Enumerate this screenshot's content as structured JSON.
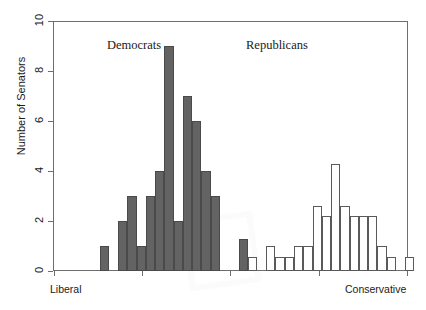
{
  "chart_data": {
    "type": "bar",
    "title": "",
    "subtitle": "",
    "xlabel": "",
    "ylabel": "Number of Senators",
    "ylim": [
      0,
      10
    ],
    "yticks": [
      0,
      2,
      4,
      6,
      8,
      10
    ],
    "ytick_labels": [
      "0",
      "2",
      "4",
      "6",
      "8",
      "10"
    ],
    "xlim": [
      0,
      1
    ],
    "xtick_labels": [
      "Liberal",
      "Conservative"
    ],
    "xtick_left_label": "Liberal",
    "xtick_right_label": "Conservative",
    "grid": false,
    "legend_position": "inline-annotations",
    "annotations": [
      {
        "text": "Democrats",
        "x": 0.26,
        "y": 9.6
      },
      {
        "text": "Republicans",
        "x": 0.66,
        "y": 9.6
      }
    ],
    "series": [
      {
        "name": "Democrats",
        "color": "#636363",
        "fill": "solid-gray",
        "bins": [
          {
            "x": 0.148,
            "width": 0.0295,
            "value": 1
          },
          {
            "x": 0.207,
            "width": 0.0295,
            "value": 2
          },
          {
            "x": 0.2365,
            "width": 0.0295,
            "value": 3
          },
          {
            "x": 0.266,
            "width": 0.0295,
            "value": 1
          },
          {
            "x": 0.2955,
            "width": 0.0295,
            "value": 3
          },
          {
            "x": 0.325,
            "width": 0.0295,
            "value": 4
          },
          {
            "x": 0.3545,
            "width": 0.0295,
            "value": 9
          },
          {
            "x": 0.384,
            "width": 0.0295,
            "value": 2
          },
          {
            "x": 0.4135,
            "width": 0.0295,
            "value": 7
          },
          {
            "x": 0.443,
            "width": 0.0295,
            "value": 6
          },
          {
            "x": 0.4725,
            "width": 0.0295,
            "value": 4
          },
          {
            "x": 0.502,
            "width": 0.0295,
            "value": 3
          },
          {
            "x": 0.5905,
            "width": 0.0295,
            "value": 1.3
          }
        ]
      },
      {
        "name": "Republicans",
        "color": "#ffffff",
        "fill": "hollow-outline",
        "bins": [
          {
            "x": 0.62,
            "width": 0.0295,
            "value": 0.55
          },
          {
            "x": 0.6785,
            "width": 0.0295,
            "value": 1.0
          },
          {
            "x": 0.708,
            "width": 0.0295,
            "value": 0.55
          },
          {
            "x": 0.7375,
            "width": 0.0295,
            "value": 0.55
          },
          {
            "x": 0.767,
            "width": 0.0295,
            "value": 1.0
          },
          {
            "x": 0.7965,
            "width": 0.0295,
            "value": 1.0
          },
          {
            "x": 0.826,
            "width": 0.0295,
            "value": 2.6
          },
          {
            "x": 0.8555,
            "width": 0.0295,
            "value": 2.2
          },
          {
            "x": 0.885,
            "width": 0.0295,
            "value": 4.3
          },
          {
            "x": 0.9145,
            "width": 0.0295,
            "value": 2.6
          },
          {
            "x": 0.944,
            "width": 0.0295,
            "value": 2.2
          },
          {
            "x": 0.9735,
            "width": 0.0295,
            "value": 2.2
          },
          {
            "x": 1.003,
            "width": 0.0295,
            "value": 2.2
          },
          {
            "x": 1.0325,
            "width": 0.0295,
            "value": 1.0
          },
          {
            "x": 1.062,
            "width": 0.0295,
            "value": 0.55
          },
          {
            "x": 1.121,
            "width": 0.0295,
            "value": 0.55
          }
        ]
      }
    ],
    "colors": {
      "democrat_fill": "#636363",
      "democrat_edge": "#4a4a4a",
      "republican_fill": "#ffffff",
      "republican_edge": "#5a5a5a",
      "axis": "#6e6e6e",
      "text": "#1a1a1a",
      "background": "#ffffff"
    }
  },
  "axes": {
    "y_axis_label": "Number of Senators",
    "y_tick_labels": [
      "10",
      "8",
      "6",
      "4",
      "2",
      "0"
    ],
    "x_left_label": "Liberal",
    "x_right_label": "Conservative"
  },
  "labels": {
    "democrats": "Democrats",
    "republicans": "Republicans"
  }
}
